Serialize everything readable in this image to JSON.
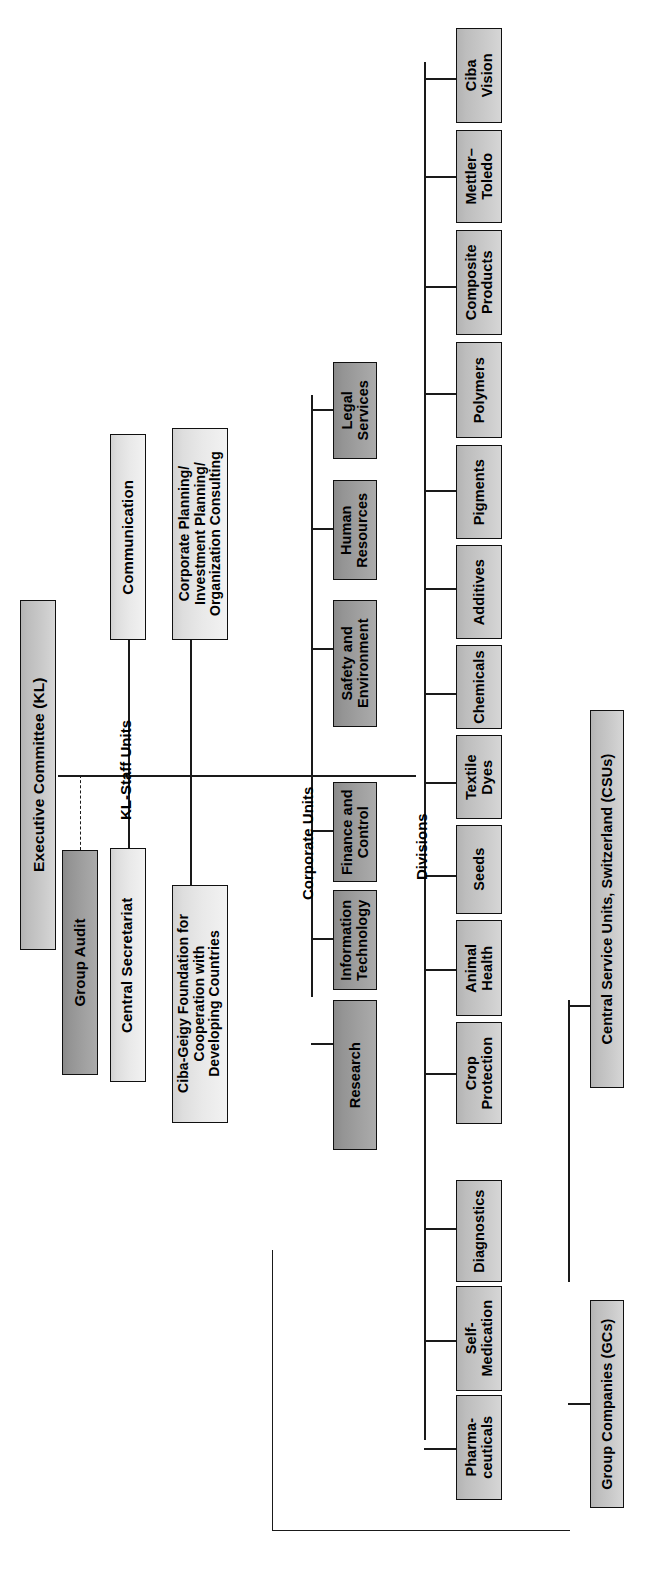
{
  "chart": {
    "orientation": "rotated-90-ccw",
    "colors": {
      "box_border": "#101010",
      "line": "#1a1a1a",
      "fill_light": "#e9e9e9",
      "fill_mid": "#c9c9c9",
      "fill_dark": "#a0a0a0",
      "background": "#ffffff"
    }
  },
  "root": {
    "label": "Executive Committee (KL)"
  },
  "section_labels": {
    "kl_staff_units": "KL-Staff Units",
    "corporate_units": "Corporate Units",
    "divisions": "Divisions"
  },
  "audit": {
    "label": "Group Audit",
    "link_style": "dashed"
  },
  "kl_staff_units": {
    "items": [
      {
        "label": "Central Secretariat"
      },
      {
        "label": "Communication"
      },
      {
        "label": "Corporate Planning/\nInvestment Planning/\nOrganization Consulting"
      },
      {
        "label": "Ciba-Geigy Foundation for\nCooperation with\nDeveloping Countries"
      }
    ]
  },
  "corporate_units": {
    "items": [
      {
        "label": "Research"
      },
      {
        "label": "Information\nTechnology"
      },
      {
        "label": "Finance and\nControl"
      },
      {
        "label": "Safety and\nEnvironment"
      },
      {
        "label": "Human\nResources"
      },
      {
        "label": "Legal\nServices"
      }
    ]
  },
  "divisions": {
    "items": [
      {
        "label": "Pharma-\nceuticals"
      },
      {
        "label": "Self-\nMedication"
      },
      {
        "label": "Diagnostics"
      },
      {
        "label": "Crop\nProtection"
      },
      {
        "label": "Animal\nHealth"
      },
      {
        "label": "Seeds"
      },
      {
        "label": "Textile\nDyes"
      },
      {
        "label": "Chemicals"
      },
      {
        "label": "Additives"
      },
      {
        "label": "Pigments"
      },
      {
        "label": "Polymers"
      },
      {
        "label": "Composite\nProducts"
      },
      {
        "label": "Mettler–\nToledo"
      },
      {
        "label": "Ciba\nVision"
      }
    ]
  },
  "bottom_units": {
    "items": [
      {
        "label": "Group Companies (GCs)"
      },
      {
        "label": "Central Service Units, Switzerland (CSUs)"
      }
    ]
  }
}
